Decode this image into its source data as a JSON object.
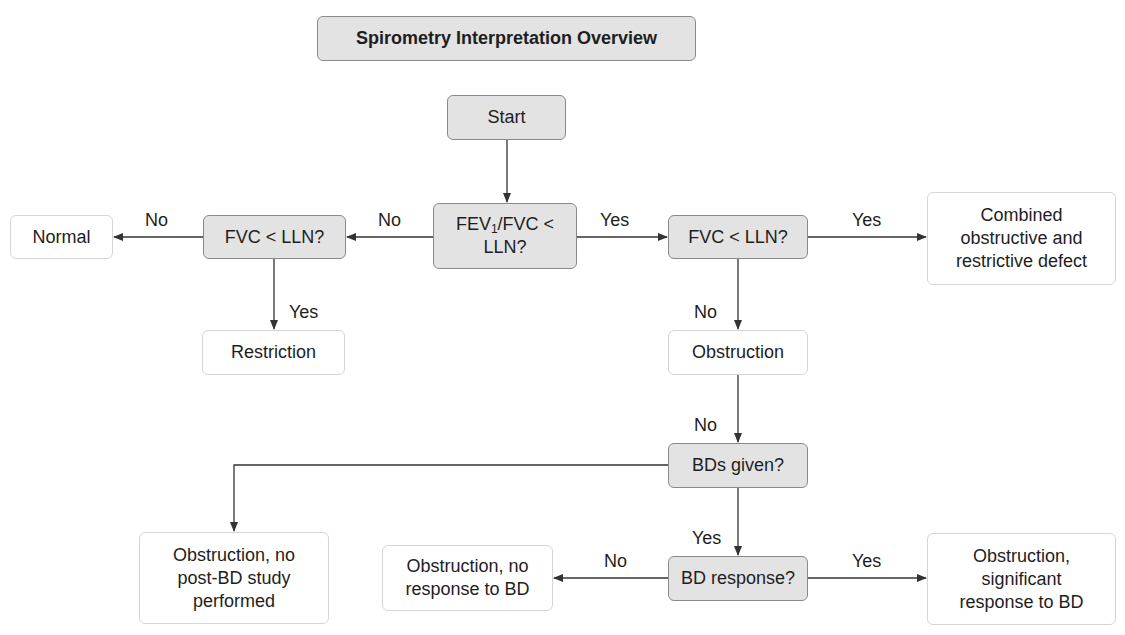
{
  "diagram": {
    "title": "Spirometry Interpretation Overview",
    "colors": {
      "decision_fill": "#e3e3e3",
      "decision_border": "#8a8a8a",
      "outcome_fill": "#ffffff",
      "outcome_border": "#d6d6d6",
      "line": "#333333"
    },
    "nodes": {
      "start": {
        "label": "Start",
        "type": "decision"
      },
      "fev1_fvc": {
        "label_main": "FEV",
        "label_sub": "1",
        "label_rest": "/FVC <",
        "label_line2": "LLN?",
        "type": "decision"
      },
      "fvc_left": {
        "label": "FVC < LLN?",
        "type": "decision"
      },
      "fvc_right": {
        "label": "FVC < LLN?",
        "type": "decision"
      },
      "normal": {
        "label": "Normal",
        "type": "outcome"
      },
      "restriction": {
        "label": "Restriction",
        "type": "outcome"
      },
      "combined": {
        "label": "Combined obstructive and restrictive defect",
        "type": "outcome"
      },
      "obstruction": {
        "label": "Obstruction",
        "type": "outcome"
      },
      "bds_given": {
        "label": "BDs given?",
        "type": "decision"
      },
      "bd_response": {
        "label": "BD response?",
        "type": "decision"
      },
      "no_post_bd": {
        "label": "Obstruction, no post-BD study performed",
        "type": "outcome"
      },
      "no_response": {
        "label": "Obstruction, no response to BD",
        "type": "outcome"
      },
      "significant_response": {
        "label": "Obstruction, significant response to BD",
        "type": "outcome"
      }
    },
    "edges": {
      "fev1_to_fvc_left": "No",
      "fvc_left_to_normal": "No",
      "fvc_left_to_restriction": "Yes",
      "fev1_to_fvc_right": "Yes",
      "fvc_right_to_combined": "Yes",
      "fvc_right_to_obstruction": "No",
      "obstruction_to_bds_given": "No",
      "bds_given_to_bd_response": "Yes",
      "bd_response_to_no_response": "No",
      "bd_response_to_significant": "Yes"
    }
  }
}
